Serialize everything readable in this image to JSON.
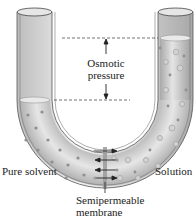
{
  "figure": {
    "labels": {
      "osmotic_line1": "Osmotic",
      "osmotic_line2": "pressure",
      "left_side": "Pure solvent",
      "right_side": "Solution",
      "membrane_line1": "Semipermeable",
      "membrane_line2": "membrane"
    },
    "colors": {
      "tube_glass": "#d9d9d9",
      "liquid": "#c4c4c4",
      "particle": "#9a9a9a",
      "line": "#222222",
      "membrane": "#8c8c8c"
    }
  }
}
